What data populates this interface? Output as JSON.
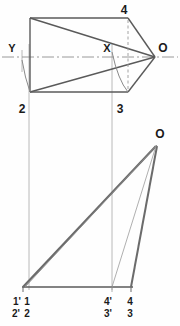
{
  "drawing": {
    "title": "Orthographic projection - top view and front view of inclined solid",
    "type": "engineering-line-drawing",
    "canvas": {
      "width": 180,
      "height": 326
    },
    "colors": {
      "object_line": "#4a4a4a",
      "thick_line": "#555555",
      "construction_line": "#9a9a9a",
      "center_line": "#8a8a8a",
      "hidden_line": "#8f8f8f",
      "text": "#1a1a1a",
      "background": "#fefefe"
    },
    "views": [
      {
        "name": "top-view",
        "labels": [
          {
            "id": "label-4-top",
            "text": "4",
            "x": 124,
            "y": 14
          },
          {
            "id": "label-O-top",
            "text": "O",
            "x": 160,
            "y": 57
          },
          {
            "id": "label-Y-top",
            "text": "Y",
            "x": 10,
            "y": 52
          },
          {
            "id": "label-X-top",
            "text": "X",
            "x": 104,
            "y": 52
          },
          {
            "id": "label-2-top",
            "text": "2",
            "x": 19,
            "y": 111
          },
          {
            "id": "label-3-top",
            "text": "3",
            "x": 118,
            "y": 111
          }
        ]
      },
      {
        "name": "front-view",
        "labels": [
          {
            "id": "label-O-front",
            "text": "O",
            "x": 155,
            "y": 137
          },
          {
            "id": "label-1prime-front",
            "text": "1'",
            "x": 17,
            "y": 301
          },
          {
            "id": "label-1-front",
            "text": "1",
            "x": 26,
            "y": 301
          },
          {
            "id": "label-2prime-front",
            "text": "2'",
            "x": 16,
            "y": 314
          },
          {
            "id": "label-2-front",
            "text": "2",
            "x": 26,
            "y": 314
          },
          {
            "id": "label-4prime-front",
            "text": "4'",
            "x": 105,
            "y": 301
          },
          {
            "id": "label-4-front",
            "text": "4",
            "x": 127,
            "y": 301
          },
          {
            "id": "label-3prime-front",
            "text": "3'",
            "x": 105,
            "y": 314
          },
          {
            "id": "label-3-front",
            "text": "3",
            "x": 127,
            "y": 314
          }
        ]
      }
    ],
    "geometry_notes": {
      "apex_top": "O at (155,57)",
      "apex_front": "O at (156,146)",
      "base_front_line": "y = 287 from x = 22 to x = 133",
      "center_line_top": "horizontal chain line at y = 57",
      "hidden_line_top": "dashed vertical at x = 128 from y = 20 to y = 92",
      "projector_left": "vertical at x = 29",
      "projector_mid": "vertical at x = 112"
    }
  }
}
